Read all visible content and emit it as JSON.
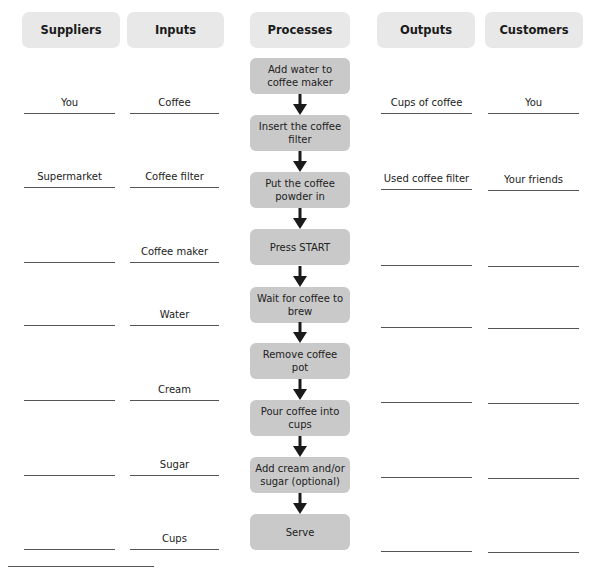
{
  "headers": {
    "suppliers": "Suppliers",
    "inputs": "Inputs",
    "processes": "Processes",
    "outputs": "Outputs",
    "customers": "Customers"
  },
  "suppliers": [
    "You",
    "Supermarket",
    "",
    "",
    "",
    "",
    ""
  ],
  "inputs": [
    "Coffee",
    "Coffee filter",
    "Coffee maker",
    "Water",
    "Cream",
    "Sugar",
    "Cups"
  ],
  "processes": [
    "Add water to coffee maker",
    "Insert the coffee filter",
    "Put the coffee powder in",
    "Press START",
    "Wait for coffee to brew",
    "Remove coffee pot",
    "Pour coffee into cups",
    "Add cream and/or sugar (optional)",
    "Serve"
  ],
  "outputs": [
    "Cups of coffee",
    "Used coffee filter",
    "",
    "",
    "",
    "",
    ""
  ],
  "customers": [
    "You",
    "Your friends",
    "",
    "",
    "",
    "",
    ""
  ],
  "colors": {
    "header_bg": "#e8e8e8",
    "process_bg": "#c9c9c9",
    "arrow": "#1a1a1a",
    "line": "#555555"
  }
}
